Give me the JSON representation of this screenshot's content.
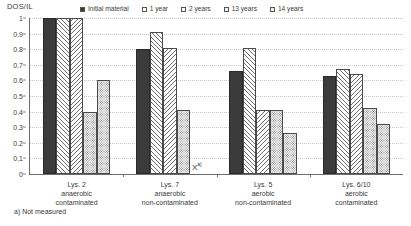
{
  "chart": {
    "yaxis_title": "DOS/IL",
    "footnote": "a) Not measured",
    "missing_marker": "X",
    "missing_marker_sup": "a)"
  },
  "legend": {
    "items": [
      {
        "label": "Initial material",
        "swatch": "solid-dark-swatch",
        "color": "#3b3b3b"
      },
      {
        "label": "1 year",
        "swatch": "hatch-forward-swatch",
        "color": "#ffffff"
      },
      {
        "label": "2 years",
        "swatch": "hatch-backward-swatch",
        "color": "#ffffff"
      },
      {
        "label": "13 years",
        "swatch": "dotted-swatch",
        "color": "#efefef"
      },
      {
        "label": "14 years",
        "swatch": "dotted-swatch",
        "color": "#efefef"
      }
    ]
  },
  "chart_data": {
    "type": "bar",
    "title": "",
    "xlabel": "",
    "ylabel": "DOS/IL",
    "ylim": [
      0,
      1
    ],
    "yticks": [
      0,
      0.1,
      0.2,
      0.3,
      0.4,
      0.5,
      0.6,
      0.7,
      0.8,
      0.9,
      1
    ],
    "ytick_labels": [
      "0",
      "0.1",
      "0.2",
      "0.3",
      "0.4",
      "0.5",
      "0.6",
      "0.7",
      "0.8",
      "0.9",
      "1"
    ],
    "grid": true,
    "grid_axis": "y",
    "legend_position": "top",
    "categories": [
      "Lys. 2\nanaerobic\ncontaminated",
      "Lys. 7\nanaerobic\nnon-contaminated",
      "Lys. 5\naerobic\nnon-contaminated",
      "Lys. 6/10\naerobic\ncontaminated"
    ],
    "category_lines": [
      [
        "Lys. 2",
        "anaerobic",
        "contaminated"
      ],
      [
        "Lys. 7",
        "anaerobic",
        "non-contaminated"
      ],
      [
        "Lys. 5",
        "aerobic",
        "non-contaminated"
      ],
      [
        "Lys. 6/10",
        "aerobic",
        "contaminated"
      ]
    ],
    "series": [
      {
        "name": "Initial material",
        "values": [
          1.0,
          0.8,
          0.66,
          0.63
        ]
      },
      {
        "name": "1 year",
        "values": [
          1.0,
          0.91,
          0.81,
          0.67
        ]
      },
      {
        "name": "2 years",
        "values": [
          1.0,
          0.81,
          0.41,
          0.64
        ]
      },
      {
        "name": "13 years",
        "values": [
          0.4,
          0.41,
          0.41,
          0.42
        ]
      },
      {
        "name": "14 years",
        "values": [
          0.6,
          null,
          0.26,
          0.32
        ]
      }
    ],
    "annotations": [
      {
        "text": "X",
        "superscript": "a)",
        "group": "Lys. 7 anaerobic non-contaminated",
        "series": "14 years",
        "note": "Not measured"
      }
    ]
  }
}
